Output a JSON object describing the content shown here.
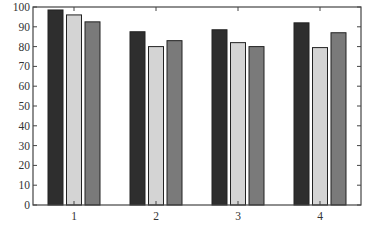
{
  "chart_data": {
    "type": "bar",
    "title": "",
    "xlabel": "",
    "ylabel": "",
    "categories": [
      "1",
      "2",
      "3",
      "4"
    ],
    "ylim": [
      0,
      100
    ],
    "yticks": [
      0,
      10,
      20,
      30,
      40,
      50,
      60,
      70,
      80,
      90,
      100
    ],
    "grid": false,
    "legend": null,
    "series": [
      {
        "name": "series-1",
        "color": "#2e2e2e",
        "values": [
          98.5,
          87.5,
          88.5,
          92
        ]
      },
      {
        "name": "series-2",
        "color": "#d4d4d4",
        "values": [
          96,
          80,
          82,
          79.5
        ]
      },
      {
        "name": "series-3",
        "color": "#7a7a7a",
        "values": [
          92.5,
          83,
          80,
          87
        ]
      }
    ]
  }
}
